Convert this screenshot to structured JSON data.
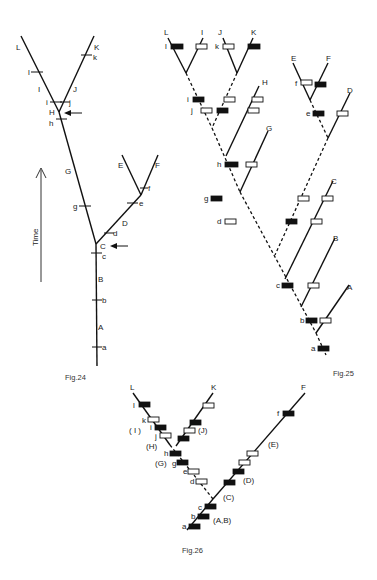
{
  "figures": {
    "fig24": {
      "caption": "Fig.24",
      "time_axis_label": "Time",
      "terminal_labels": {
        "L": "L",
        "K": "K",
        "E": "E",
        "F": "F"
      },
      "segment_labels": {
        "I": "I",
        "J": "J",
        "H": "H",
        "G": "G",
        "D": "D",
        "C": "C",
        "B": "B",
        "A": "A"
      },
      "tick_labels": {
        "l": "l",
        "k": "k",
        "i": "i",
        "j": "j",
        "h": "h",
        "g": "g",
        "e": "e",
        "f": "f",
        "d": "d",
        "c": "c",
        "b": "b",
        "a": "a"
      }
    },
    "fig25": {
      "caption": "Fig.25",
      "terminal_labels": {
        "L": "L",
        "I": "I",
        "J": "J",
        "K": "K",
        "H": "H",
        "G": "G",
        "E": "E",
        "F": "F",
        "D": "D",
        "C": "C",
        "B": "B",
        "A": "A"
      },
      "character_labels": {
        "l": "l",
        "k": "k",
        "i": "i",
        "j": "j",
        "h": "h",
        "g": "g",
        "d": "d",
        "f": "f",
        "e": "e",
        "c": "c",
        "b": "b",
        "a": "a"
      }
    },
    "fig26": {
      "caption": "Fig.26",
      "terminal_labels": {
        "L": "L",
        "K": "K",
        "F": "F"
      },
      "group_labels": {
        "I": "( I )",
        "J": "(J)",
        "H": "(H)",
        "G": "(G)",
        "E": "(E)",
        "D": "(D)",
        "C": "(C)",
        "AB": "(A,B)"
      },
      "character_labels": {
        "l": "l",
        "k": "k",
        "i": "i",
        "j": "j",
        "h": "h",
        "g": "g",
        "e": "e",
        "d": "d",
        "f": "f",
        "c": "c",
        "b": "b",
        "a": "a"
      }
    }
  }
}
